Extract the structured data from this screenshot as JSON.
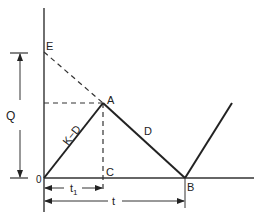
{
  "diagram": {
    "type": "inventory-level-sawtooth",
    "points": {
      "O": {
        "label": "0",
        "x": 44,
        "y": 178
      },
      "E": {
        "label": "E",
        "x": 44,
        "y": 52
      },
      "A": {
        "label": "A",
        "x": 103,
        "y": 103
      },
      "C": {
        "label": "C",
        "x": 103,
        "y": 178
      },
      "B": {
        "label": "B",
        "x": 185,
        "y": 178
      }
    },
    "segments": {
      "rising": {
        "label": "K−D"
      },
      "falling": {
        "label": "D"
      }
    },
    "dimensions": {
      "q": {
        "label": "Q"
      },
      "t1": {
        "label": "t",
        "subscript": "1"
      },
      "t": {
        "label": "t"
      }
    }
  }
}
